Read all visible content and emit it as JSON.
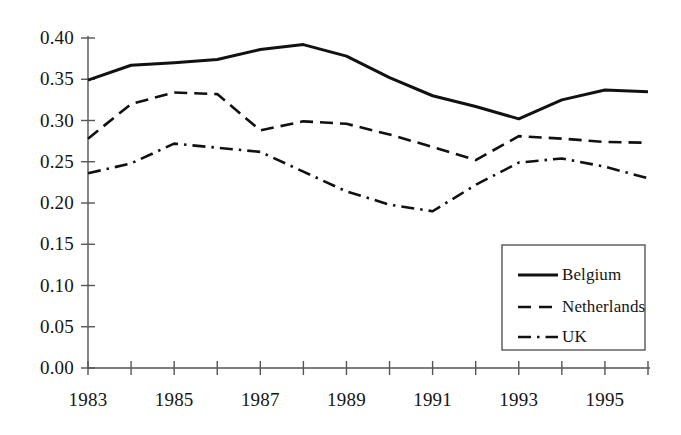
{
  "chart_data": {
    "type": "line",
    "title": "",
    "xlabel": "",
    "ylabel": "",
    "x": [
      1983,
      1984,
      1985,
      1986,
      1987,
      1988,
      1989,
      1990,
      1991,
      1992,
      1993,
      1994,
      1995,
      1996
    ],
    "xlim": [
      1983,
      1996
    ],
    "ylim": [
      0.0,
      0.4
    ],
    "grid": false,
    "legend_position": "lower-right",
    "x_tick_values": [
      1983,
      1984,
      1985,
      1986,
      1987,
      1988,
      1989,
      1990,
      1991,
      1992,
      1993,
      1994,
      1995,
      1996
    ],
    "x_tick_labels": [
      "1983",
      "",
      "1985",
      "",
      "1987",
      "",
      "1989",
      "",
      "1991",
      "",
      "1993",
      "",
      "1995",
      ""
    ],
    "x_labels_shown": [
      "1983",
      "1985",
      "1987",
      "1989",
      "1991",
      "1993",
      "1995"
    ],
    "y_tick_values": [
      0.0,
      0.05,
      0.1,
      0.15,
      0.2,
      0.25,
      0.3,
      0.35,
      0.4
    ],
    "y_tick_labels": [
      "0.00",
      "0.05",
      "0.10",
      "0.15",
      "0.20",
      "0.25",
      "0.30",
      "0.35",
      "0.40"
    ],
    "series": [
      {
        "name": "Belgium",
        "style": "solid",
        "color": "#111111",
        "values": [
          0.349,
          0.367,
          0.37,
          0.374,
          0.386,
          0.392,
          0.378,
          0.352,
          0.33,
          0.317,
          0.302,
          0.325,
          0.337,
          0.335
        ]
      },
      {
        "name": "Netherlands",
        "style": "dashed",
        "color": "#111111",
        "values": [
          0.278,
          0.32,
          0.334,
          0.332,
          0.288,
          0.299,
          0.296,
          0.283,
          0.268,
          0.252,
          0.281,
          0.278,
          0.274,
          0.273
        ]
      },
      {
        "name": "UK",
        "style": "dashdot",
        "color": "#111111",
        "values": [
          0.236,
          0.248,
          0.272,
          0.267,
          0.262,
          0.238,
          0.214,
          0.198,
          0.19,
          0.222,
          0.249,
          0.254,
          0.244,
          0.23
        ]
      }
    ]
  },
  "legend": {
    "entries": [
      {
        "label": "Belgium"
      },
      {
        "label": "Netherlands"
      },
      {
        "label": "UK"
      }
    ]
  },
  "axis": {
    "line_color": "#555555"
  }
}
